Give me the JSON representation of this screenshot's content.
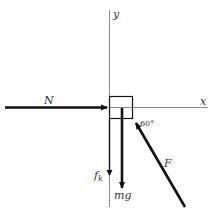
{
  "diagram": {
    "axes": {
      "x_label": "x",
      "y_label": "y"
    },
    "forces": [
      {
        "id": "N",
        "label": "N",
        "direction": "right (toward block, +x)"
      },
      {
        "id": "fk",
        "label_main": "f",
        "label_sub": "k",
        "direction": "down (-y)"
      },
      {
        "id": "mg",
        "label": "mg",
        "direction": "down (-y)"
      },
      {
        "id": "F",
        "label": "F",
        "direction": "up-left, 60° below +x axis measured from block"
      }
    ],
    "angle_label": "60°",
    "colors": {
      "axis": "#8a8a8a",
      "arrow": "#111111",
      "text": "#333333",
      "background": "#ffffff"
    }
  }
}
